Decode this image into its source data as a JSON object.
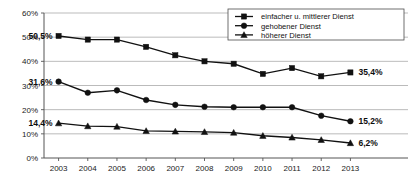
{
  "chart_data": {
    "type": "line",
    "title": "",
    "xlabel": "",
    "ylabel": "",
    "categories": [
      "2003",
      "2004",
      "2005",
      "2006",
      "2007",
      "2008",
      "2009",
      "2010",
      "2011",
      "2012",
      "2013"
    ],
    "ylim": [
      0,
      60
    ],
    "ytick_values": [
      0,
      10,
      20,
      30,
      40,
      50,
      60
    ],
    "ytick_labels": [
      "0%",
      "10%",
      "20%",
      "30%",
      "40%",
      "50%",
      "60%"
    ],
    "grid": true,
    "legend_position": "top-right",
    "series": [
      {
        "name": "einfacher u. mittlerer Dienst",
        "marker": "square",
        "values": [
          50.5,
          49.0,
          49.0,
          46.0,
          42.5,
          40.0,
          39.0,
          34.8,
          37.2,
          33.8,
          35.4
        ],
        "start_label": "50,5%",
        "end_label": "35,4%"
      },
      {
        "name": "gehobener Dienst",
        "marker": "circle",
        "values": [
          31.6,
          27.0,
          28.0,
          24.0,
          22.0,
          21.2,
          21.0,
          21.0,
          21.0,
          17.5,
          15.2
        ],
        "start_label": "31,6%",
        "end_label": "15,2%"
      },
      {
        "name": "höherer Dienst",
        "marker": "triangle",
        "values": [
          14.4,
          13.2,
          13.0,
          11.2,
          11.0,
          10.8,
          10.5,
          9.2,
          8.5,
          7.5,
          6.2
        ],
        "start_label": "14,4%",
        "end_label": "6,2%"
      }
    ],
    "colors": {
      "line": "#111111",
      "marker": "#111111",
      "grid": "#aaaaaa",
      "axis": "#555555",
      "background": "#ffffff"
    }
  },
  "legend": {
    "items": [
      {
        "label": "einfacher u. mittlerer Dienst",
        "marker": "square"
      },
      {
        "label": "gehobener Dienst",
        "marker": "circle"
      },
      {
        "label": "höherer Dienst",
        "marker": "triangle"
      }
    ]
  }
}
